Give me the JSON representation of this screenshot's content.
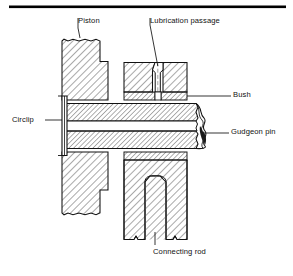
{
  "figure": {
    "type": "engineering-cross-section",
    "rule": {
      "present": true,
      "color": "#000000",
      "thickness_px": 3
    },
    "colors": {
      "ink": "#111111",
      "hatch": "#222222",
      "background": "#ffffff"
    }
  },
  "labels": {
    "piston": "Piston",
    "lubrication_passage": "Lubrication passage",
    "bush": "Bush",
    "gudgeon_pin": "Gudgeon pin",
    "circlip": "Circlip",
    "connecting_rod": "Connecting rod"
  },
  "parts": [
    {
      "name": "piston",
      "label": "Piston",
      "section": "hatched",
      "hatch_direction": "right"
    },
    {
      "name": "lubrication-passage",
      "label": "Lubrication passage",
      "section": "void",
      "shape": "tapered-funnel"
    },
    {
      "name": "bush",
      "label": "Bush",
      "section": "hatched",
      "hatch_direction": "right"
    },
    {
      "name": "gudgeon-pin",
      "label": "Gudgeon pin",
      "section": "hatched-tube",
      "break": "wavy-broken-section"
    },
    {
      "name": "circlip",
      "label": "Circlip",
      "section": "solid-bar"
    },
    {
      "name": "connecting-rod",
      "label": "Connecting rod",
      "section": "hatched",
      "hatch_direction": "right"
    }
  ]
}
